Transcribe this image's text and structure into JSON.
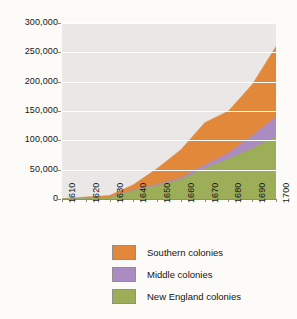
{
  "chart_data": {
    "type": "area",
    "stacked": true,
    "title": "",
    "subtitle": "",
    "xlabel": "",
    "ylabel": "",
    "grid": true,
    "legend_position": "bottom",
    "x": [
      1610,
      1620,
      1630,
      1640,
      1650,
      1660,
      1670,
      1680,
      1690,
      1700
    ],
    "xtick_labels": [
      "1610",
      "1620",
      "1630",
      "1640",
      "1650",
      "1660",
      "1670",
      "1680",
      "1690",
      "1700"
    ],
    "ytick_labels": [
      "0",
      "50,000",
      "100,000",
      "150,000",
      "200,000",
      "250,000",
      "300,000"
    ],
    "ytick_values": [
      0,
      50000,
      100000,
      150000,
      200000,
      250000,
      300000
    ],
    "ylim": [
      0,
      300000
    ],
    "xlim": [
      1610,
      1700
    ],
    "series": [
      {
        "name": "New England colonies",
        "color": "#9cae57",
        "values": [
          0,
          1000,
          2000,
          14000,
          23000,
          33000,
          52000,
          68000,
          86000,
          106000
        ]
      },
      {
        "name": "Middle colonies",
        "color": "#ab8cc2",
        "values": [
          0,
          500,
          500,
          1500,
          2000,
          3000,
          6000,
          10000,
          22000,
          34000
        ]
      },
      {
        "name": "Southern colonies",
        "color": "#e2883b",
        "values": [
          500,
          2000,
          3500,
          9000,
          27000,
          48000,
          72000,
          72000,
          87000,
          120000
        ]
      }
    ],
    "totals": [
      500,
      3500,
      6000,
      24500,
      52000,
      84000,
      130000,
      150000,
      195000,
      260000
    ]
  },
  "legend": {
    "items": [
      {
        "label": "Southern colonies",
        "color": "#e2883b"
      },
      {
        "label": "Middle colonies",
        "color": "#ab8cc2"
      },
      {
        "label": "New England colonies",
        "color": "#9cae57"
      }
    ]
  }
}
